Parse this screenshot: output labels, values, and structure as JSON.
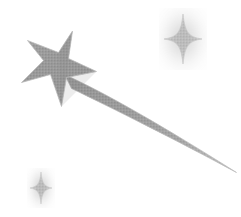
{
  "artwork": {
    "title": "Shooting Star",
    "description": "Grayscale halftone clipart of a shooting star with a curved tapering trail and two four-point sparkles",
    "width": 241,
    "height": 217,
    "background_color": "#ffffff",
    "ink_color": "#9a9a9a",
    "ink_color_dark": "#8a8a8a",
    "ink_color_light": "#b4b4b4",
    "edge_color": "#c9c9c9",
    "texture": "halftone-dither"
  },
  "elements": [
    {
      "id": "main-star",
      "name": "five-point-star",
      "label": "Main five-pointed star",
      "center_x": 60,
      "center_y": 70,
      "points": 5,
      "bounds": {
        "x": 21,
        "y": 31,
        "width": 76,
        "height": 76
      }
    },
    {
      "id": "star-trail",
      "name": "star-trail",
      "label": "Curved tapering motion trail",
      "start_x": 66,
      "start_y": 78,
      "end_x": 236,
      "end_y": 173,
      "bounds": {
        "x": 62,
        "y": 74,
        "width": 175,
        "height": 100
      }
    },
    {
      "id": "sparkle-top-right",
      "name": "four-point-sparkle",
      "label": "Upper right four-point sparkle",
      "center_x": 183,
      "center_y": 39,
      "points": 4,
      "half_width": 19,
      "half_height": 25,
      "bounds": {
        "x": 164,
        "y": 14,
        "width": 38,
        "height": 50
      }
    },
    {
      "id": "sparkle-bottom-left",
      "name": "four-point-sparkle",
      "label": "Lower left four-point sparkle",
      "center_x": 41,
      "center_y": 188,
      "points": 4,
      "half_width": 11,
      "half_height": 16,
      "bounds": {
        "x": 30,
        "y": 172,
        "width": 22,
        "height": 32
      }
    }
  ],
  "accessibility": {
    "alt_text": "Shooting Star"
  }
}
